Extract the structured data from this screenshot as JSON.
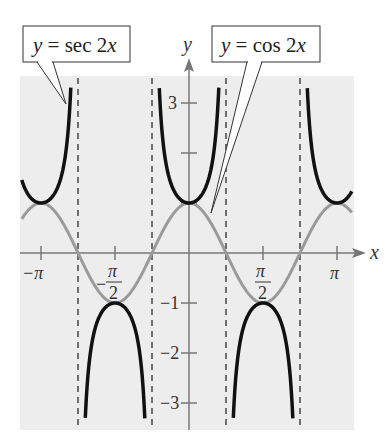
{
  "chart_data": {
    "type": "line",
    "title": "",
    "xlabel": "x",
    "ylabel": "y",
    "xlim": [
      -3.55,
      3.46
    ],
    "ylim": [
      -3.5,
      3.5
    ],
    "grid": false,
    "background": "#ededed",
    "x_ticks": [
      {
        "value": -3.14159,
        "label": "−π"
      },
      {
        "value": -1.5708,
        "label": "−π/2"
      },
      {
        "value": 1.5708,
        "label": "π/2"
      },
      {
        "value": 3.14159,
        "label": "π"
      }
    ],
    "y_ticks": [
      {
        "value": 3,
        "label": "3"
      },
      {
        "value": 2,
        "label": ""
      },
      {
        "value": 1,
        "label": ""
      },
      {
        "value": -1,
        "label": "−1"
      },
      {
        "value": -2,
        "label": "−2"
      },
      {
        "value": -3,
        "label": "−3"
      }
    ],
    "asymptotes": [
      -2.35619,
      -0.785398,
      0.785398,
      2.35619
    ],
    "series": [
      {
        "name": "y = sec 2x",
        "function": "sec(2x)",
        "color": "#111111",
        "width": 3.5
      },
      {
        "name": "y = cos 2x",
        "function": "cos(2x)",
        "color": "#9a9a9a",
        "width": 3
      }
    ],
    "annotations": [
      {
        "text": "y = sec 2x",
        "box": [
          23,
          26,
          107,
          36
        ],
        "pointer_to": [
          66,
          104
        ]
      },
      {
        "text": "y = cos 2x",
        "box": [
          212,
          26,
          108,
          36
        ],
        "pointer_to": [
          211,
          213
        ]
      }
    ]
  },
  "labels": {
    "sec_callout": {
      "y": "y",
      "eq": " = sec 2",
      "x": "x"
    },
    "cos_callout": {
      "y": "y",
      "eq": " = cos 2",
      "x": "x"
    },
    "x_axis": "x",
    "y_axis": "y",
    "neg_pi": "−π",
    "pi": "π",
    "pi_num": "π",
    "two": "2",
    "minus": "−",
    "y3": "3",
    "ym1": "−1",
    "ym2": "−2",
    "ym3": "−3"
  }
}
